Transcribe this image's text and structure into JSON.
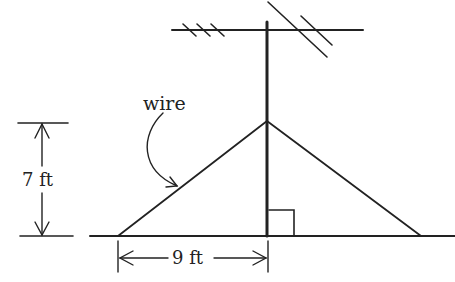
{
  "diagram": {
    "labels": {
      "wire": "wire",
      "height": "7 ft",
      "base": "9 ft"
    },
    "colors": {
      "stroke": "#222222",
      "background": "#ffffff"
    }
  }
}
